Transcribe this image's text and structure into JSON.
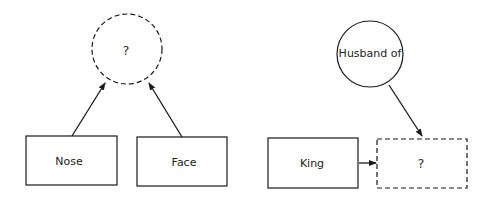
{
  "left_diagram": {
    "unknown_node": {
      "label": "?",
      "shape": "circle",
      "border": "dashed"
    },
    "inputs": [
      {
        "label": "Nose",
        "shape": "rectangle",
        "border": "solid"
      },
      {
        "label": "Face",
        "shape": "rectangle",
        "border": "solid"
      }
    ],
    "edges": [
      "Nose -> ?",
      "Face -> ?"
    ]
  },
  "right_diagram": {
    "relation_node": {
      "label": "Husband of",
      "shape": "circle",
      "border": "solid"
    },
    "input": {
      "label": "King",
      "shape": "rectangle",
      "border": "solid"
    },
    "unknown_node": {
      "label": "?",
      "shape": "rectangle",
      "border": "dashed"
    },
    "edges": [
      "Husband of -> ?",
      "King -> ?"
    ]
  },
  "colors": {
    "stroke": "#1a1a1a",
    "background": "#ffffff"
  }
}
